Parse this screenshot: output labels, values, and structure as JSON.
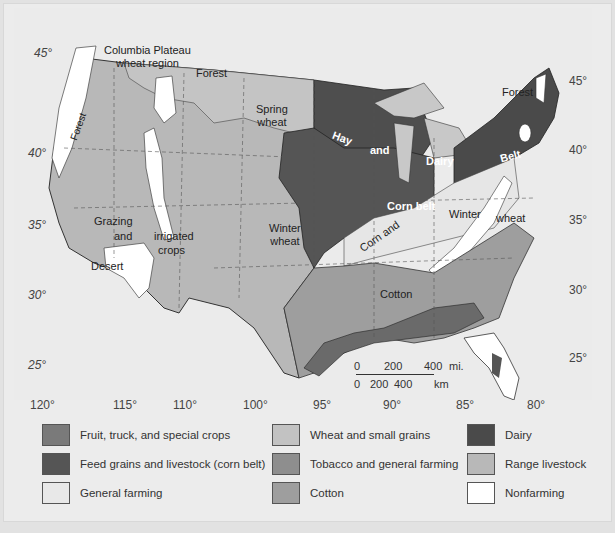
{
  "map": {
    "title_labels": {
      "columbia": [
        "Columbia Plateau",
        "wheat region"
      ],
      "forest_nw": "Forest",
      "forest_ne": "Forest",
      "forest_coast": "Forest",
      "spring_wheat": [
        "Spring",
        "wheat"
      ],
      "hay": "Hay",
      "and1": "and",
      "dairy": "Dairy",
      "belt": "Belt",
      "corn_belt": "Corn belt",
      "winter1": "Winter",
      "wheat_east": "wheat",
      "corn_and": "Corn and",
      "grazing": "Grazing",
      "and2": "and",
      "irrigated": "irrigated",
      "crops": "crops",
      "desert": "Desert",
      "winter_wheat": [
        "Winter",
        "wheat"
      ],
      "cotton": "Cotton"
    },
    "latitudes_left": [
      "45°",
      "40°",
      "35°",
      "30°",
      "25°"
    ],
    "latitudes_right": [
      "45°",
      "40°",
      "35°",
      "30°",
      "25°"
    ],
    "longitudes": [
      "120°",
      "115°",
      "110°",
      "100°",
      "95°",
      "90°",
      "85°",
      "80°"
    ],
    "scale": {
      "miles_ticks": [
        "0",
        "200",
        "400"
      ],
      "miles_unit": "mi.",
      "km_ticks": [
        "0",
        "200",
        "400"
      ],
      "km_unit": "km"
    }
  },
  "legend": {
    "items": [
      {
        "label": "Fruit, truck, and special crops",
        "color": "#7a7a7a"
      },
      {
        "label": "Feed grains and livestock (corn belt)",
        "color": "#555555"
      },
      {
        "label": "General farming",
        "color": "#e8e8e8"
      },
      {
        "label": "Wheat and small grains",
        "color": "#c2c2c2"
      },
      {
        "label": "Tobacco and general farming",
        "color": "#8e8e8e"
      },
      {
        "label": "Cotton",
        "color": "#9e9e9e"
      },
      {
        "label": "Dairy",
        "color": "#4a4a4a"
      },
      {
        "label": "Range livestock",
        "color": "#b8b8b8"
      },
      {
        "label": "Nonfarming",
        "color": "#ffffff"
      }
    ]
  }
}
